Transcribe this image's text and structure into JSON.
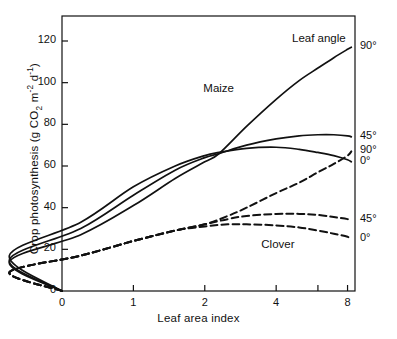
{
  "chart_data": {
    "type": "line",
    "title": "",
    "xlabel": "Leaf area index",
    "ylabel": "Crop photosynthesis (g CO2 m-2 d-1)",
    "ylabel_parts": {
      "lead": "Crop photosynthesis (g CO",
      "sub1": "2",
      "mid": " m",
      "sup1": "-2",
      "mid2": " d",
      "sup2": "-1",
      "tail": ")"
    },
    "xscale": "log",
    "xlim": [
      0.5,
      8.6
    ],
    "ylim": [
      0,
      132
    ],
    "grid": false,
    "legend_position": "right-of-axes",
    "legend_title": "Leaf angle",
    "xticks": [
      {
        "value": 0,
        "label": "0"
      },
      {
        "value": 1,
        "label": "1"
      },
      {
        "value": 2,
        "label": "2"
      },
      {
        "value": 4,
        "label": "4"
      },
      {
        "value": 6,
        "label": ""
      },
      {
        "value": 8,
        "label": "8"
      }
    ],
    "yticks": [
      {
        "value": 0,
        "label": "0"
      },
      {
        "value": 20,
        "label": "20"
      },
      {
        "value": 40,
        "label": "40"
      },
      {
        "value": 60,
        "label": "60"
      },
      {
        "value": 80,
        "label": "80"
      },
      {
        "value": 100,
        "label": "100"
      },
      {
        "value": 120,
        "label": "120"
      }
    ],
    "group_annotations": [
      {
        "text": "Maize",
        "x": 2.05,
        "y": 96
      },
      {
        "text": "Clover",
        "x": 3.6,
        "y": 21
      }
    ],
    "series": [
      {
        "name": "Maize 90",
        "crop": "Maize",
        "leaf_angle": "90°",
        "style": "solid",
        "end_label": "90°",
        "x": [
          0.0,
          0.3,
          0.6,
          1.0,
          1.5,
          2.0,
          2.3,
          3.0,
          4.0,
          5.0,
          6.0,
          7.0,
          8.0,
          8.3
        ],
        "values": [
          0,
          14,
          27,
          41,
          54,
          62,
          66,
          79,
          92,
          101,
          107,
          112,
          116,
          117
        ]
      },
      {
        "name": "Maize 45",
        "crop": "Maize",
        "leaf_angle": "45°",
        "style": "solid",
        "end_label": "45°",
        "x": [
          0.0,
          0.3,
          0.6,
          1.0,
          1.5,
          2.0,
          2.3,
          3.0,
          4.0,
          5.0,
          6.0,
          7.0,
          8.0,
          8.3
        ],
        "values": [
          0,
          15,
          30,
          46,
          58,
          64,
          66,
          70,
          73,
          74.5,
          75,
          75,
          74.5,
          74
        ]
      },
      {
        "name": "Maize 0",
        "crop": "Maize",
        "leaf_angle": "0°",
        "style": "solid",
        "end_label": "0°",
        "x": [
          0.0,
          0.3,
          0.6,
          1.0,
          1.5,
          2.0,
          2.3,
          3.0,
          4.0,
          5.0,
          6.0,
          7.0,
          8.0,
          8.3
        ],
        "values": [
          0,
          17,
          33,
          50,
          60,
          65,
          66.5,
          68.5,
          69,
          68,
          66.5,
          65,
          63,
          62
        ]
      },
      {
        "name": "Clover 90",
        "crop": "Clover",
        "leaf_angle": "90°",
        "style": "dashed",
        "end_label": "90°",
        "x": [
          0.0,
          0.3,
          0.6,
          1.0,
          1.5,
          2.0,
          2.5,
          3.0,
          4.0,
          5.0,
          6.0,
          7.0,
          8.0,
          8.3
        ],
        "values": [
          0,
          9,
          17,
          24,
          29,
          32,
          36,
          40,
          47,
          52,
          57,
          61,
          65,
          67
        ]
      },
      {
        "name": "Clover 45",
        "crop": "Clover",
        "leaf_angle": "45°",
        "style": "dashed",
        "end_label": "45°",
        "x": [
          0.0,
          0.3,
          0.6,
          1.0,
          1.5,
          2.0,
          2.5,
          3.0,
          4.0,
          5.0,
          6.0,
          7.0,
          8.0,
          8.3
        ],
        "values": [
          0,
          9,
          17,
          24,
          29,
          32,
          34.5,
          36,
          37,
          37,
          36.5,
          35.5,
          34.5,
          34
        ]
      },
      {
        "name": "Clover 0",
        "crop": "Clover",
        "leaf_angle": "0°",
        "style": "dashed",
        "end_label": "0°",
        "x": [
          0.0,
          0.3,
          0.6,
          1.0,
          1.5,
          2.0,
          2.5,
          3.0,
          4.0,
          5.0,
          6.0,
          7.0,
          8.0,
          8.3
        ],
        "values": [
          0,
          9,
          17,
          24,
          29,
          31,
          32,
          32,
          31.5,
          30.5,
          29,
          27.5,
          26,
          25
        ]
      }
    ],
    "colors": {
      "line": "#111111",
      "axis": "#111111",
      "background": "#ffffff"
    }
  }
}
